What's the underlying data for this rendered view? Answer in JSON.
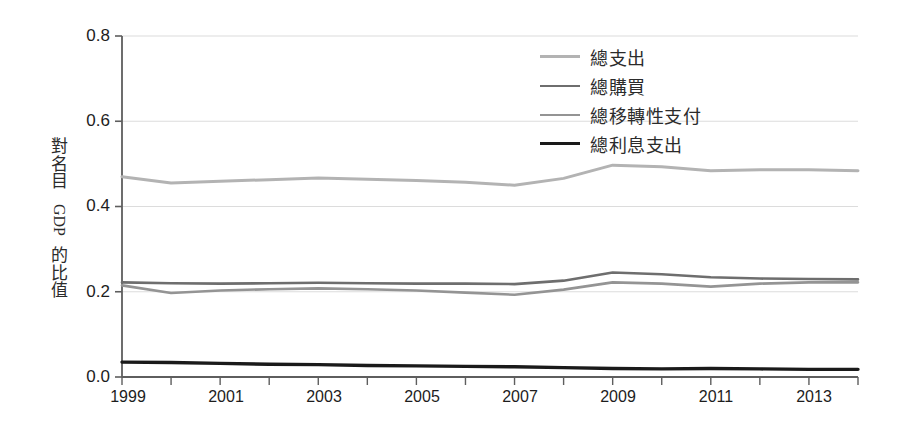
{
  "chart_data": {
    "type": "line",
    "title": "",
    "xlabel": "",
    "ylabel": "對名目 GDP 的比值",
    "ylabel_parts": [
      "對",
      "名",
      "目",
      "GDP",
      "的",
      "比",
      "值"
    ],
    "xlim": [
      1999,
      2014
    ],
    "ylim": [
      0.0,
      0.8
    ],
    "ytick_labels": [
      "0.8",
      "0.6",
      "0.4",
      "0.2",
      "0.0"
    ],
    "ytick_values": [
      0.8,
      0.6,
      0.4,
      0.2,
      0.0
    ],
    "xtick_labels": [
      "1999",
      "2001",
      "2003",
      "2005",
      "2007",
      "2009",
      "2011",
      "2013"
    ],
    "xtick_values": [
      1999,
      2001,
      2003,
      2005,
      2007,
      2009,
      2011,
      2013
    ],
    "x_minor_ticks": [
      2000,
      2002,
      2004,
      2006,
      2008,
      2010,
      2012,
      2014
    ],
    "grid": "horizontal",
    "legend_position": "top-right",
    "x": [
      1999,
      2000,
      2001,
      2002,
      2003,
      2004,
      2005,
      2006,
      2007,
      2008,
      2009,
      2010,
      2011,
      2012,
      2013,
      2014
    ],
    "series": [
      {
        "name": "總支出",
        "color": "#b3b3b3",
        "width": 3.0,
        "values": [
          0.47,
          0.455,
          0.459,
          0.463,
          0.467,
          0.464,
          0.461,
          0.457,
          0.45,
          0.466,
          0.497,
          0.493,
          0.484,
          0.486,
          0.486,
          0.484
        ]
      },
      {
        "name": "總購買",
        "color": "#6e6e6e",
        "width": 2.6,
        "values": [
          0.222,
          0.22,
          0.219,
          0.22,
          0.221,
          0.22,
          0.219,
          0.219,
          0.218,
          0.226,
          0.245,
          0.241,
          0.234,
          0.231,
          0.23,
          0.229
        ]
      },
      {
        "name": "總移轉性支付",
        "color": "#949494",
        "width": 2.6,
        "values": [
          0.215,
          0.197,
          0.203,
          0.206,
          0.208,
          0.206,
          0.203,
          0.198,
          0.193,
          0.205,
          0.222,
          0.219,
          0.212,
          0.219,
          0.222,
          0.222
        ]
      },
      {
        "name": "總利息支出",
        "color": "#1a1a1a",
        "width": 3.4,
        "values": [
          0.035,
          0.034,
          0.032,
          0.03,
          0.029,
          0.027,
          0.026,
          0.025,
          0.024,
          0.022,
          0.02,
          0.019,
          0.02,
          0.019,
          0.018,
          0.018
        ]
      }
    ]
  },
  "axes_geometry": {
    "plot_left": 122,
    "plot_right": 858,
    "plot_top": 36,
    "plot_bottom": 377
  },
  "colors": {
    "axis": "#5e5e5e",
    "grid": "#dcdcdc",
    "text": "#1d1d1d",
    "background": "#ffffff"
  }
}
